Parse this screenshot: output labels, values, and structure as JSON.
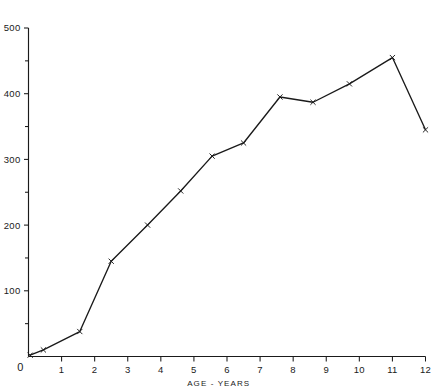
{
  "chart_data": {
    "type": "line",
    "title": "",
    "subtitle": "",
    "xlabel": "AGE - YEARS",
    "ylabel": "",
    "xlim": [
      0,
      12
    ],
    "ylim": [
      0,
      500
    ],
    "grid": false,
    "legend": null,
    "marker": "x",
    "line_color": "#1a1a1a",
    "x_ticks": [
      0,
      1,
      2,
      3,
      4,
      5,
      6,
      7,
      8,
      9,
      10,
      11,
      12
    ],
    "x_tick_labels": [
      "0",
      "1",
      "2",
      "3",
      "4",
      "5",
      "6",
      "7",
      "8",
      "9",
      "10",
      "11",
      "12"
    ],
    "y_ticks": [
      0,
      50,
      100,
      150,
      200,
      250,
      300,
      350,
      400,
      450,
      500
    ],
    "y_tick_labels": [
      "",
      "",
      "100",
      "",
      "200",
      "",
      "300",
      "",
      "400",
      "",
      "500"
    ],
    "y_major_ticks": [
      100,
      200,
      300,
      400,
      500
    ],
    "origin_label": "0",
    "series": [
      {
        "name": "growth-curve",
        "x": [
          0.05,
          0.45,
          1.55,
          2.5,
          3.6,
          4.6,
          5.55,
          6.5,
          7.6,
          8.6,
          9.7,
          11.0,
          12.0
        ],
        "values": [
          2,
          10,
          38,
          145,
          200,
          252,
          305,
          325,
          395,
          387,
          415,
          455,
          345
        ]
      }
    ]
  },
  "figure": {
    "axis_color": "#1a1a1a",
    "background": "#ffffff"
  }
}
